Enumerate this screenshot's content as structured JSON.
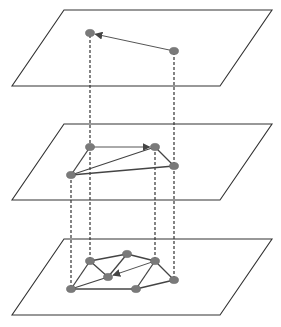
{
  "diagram": {
    "colors": {
      "plane_stroke": "#333333",
      "edge": "#444444",
      "arrow_edge": "#555555",
      "node_fill": "#7a7a7a",
      "dash": "#333333"
    },
    "planes": [
      {
        "name": "top-plane",
        "points": "64,10 272,10 220,86 12,86"
      },
      {
        "name": "middle-plane",
        "points": "64,124 272,124 220,200 12,200"
      },
      {
        "name": "bottom-plane",
        "points": "64,239 272,239 220,315 12,315"
      }
    ],
    "dashed_lines": [
      {
        "x1": 90,
        "y1": 35,
        "x2": 90,
        "y2": 147
      },
      {
        "x1": 174,
        "y1": 52,
        "x2": 174,
        "y2": 166
      },
      {
        "x1": 90,
        "y1": 147,
        "x2": 90,
        "y2": 261
      },
      {
        "x1": 155,
        "y1": 147,
        "x2": 155,
        "y2": 261
      },
      {
        "x1": 174,
        "y1": 166,
        "x2": 174,
        "y2": 280
      },
      {
        "x1": 71,
        "y1": 175,
        "x2": 71,
        "y2": 289
      }
    ],
    "layers": [
      {
        "name": "top",
        "nodes": [
          {
            "id": "t1",
            "x": 90,
            "y": 33
          },
          {
            "id": "t2",
            "x": 174,
            "y": 51
          }
        ],
        "edges": [],
        "arrows": [
          {
            "from": "t2",
            "to": "t1"
          }
        ]
      },
      {
        "name": "middle",
        "nodes": [
          {
            "id": "m1",
            "x": 90,
            "y": 147
          },
          {
            "id": "m2",
            "x": 155,
            "y": 147
          },
          {
            "id": "m3",
            "x": 174,
            "y": 166
          },
          {
            "id": "m4",
            "x": 71,
            "y": 175
          }
        ],
        "edges": [
          {
            "from": "m1",
            "to": "m4"
          },
          {
            "from": "m4",
            "to": "m2"
          },
          {
            "from": "m4",
            "to": "m3"
          },
          {
            "from": "m2",
            "to": "m3"
          }
        ],
        "arrows": [
          {
            "from": "m1",
            "to": "m2"
          }
        ]
      },
      {
        "name": "bottom",
        "nodes": [
          {
            "id": "b1",
            "x": 90,
            "y": 261
          },
          {
            "id": "b2",
            "x": 127,
            "y": 254
          },
          {
            "id": "b3",
            "x": 155,
            "y": 261
          },
          {
            "id": "b4",
            "x": 108,
            "y": 277
          },
          {
            "id": "b5",
            "x": 71,
            "y": 289
          },
          {
            "id": "b6",
            "x": 136,
            "y": 289
          },
          {
            "id": "b7",
            "x": 174,
            "y": 280
          }
        ],
        "edges": [
          {
            "from": "b1",
            "to": "b2"
          },
          {
            "from": "b2",
            "to": "b3"
          },
          {
            "from": "b1",
            "to": "b5"
          },
          {
            "from": "b1",
            "to": "b4"
          },
          {
            "from": "b2",
            "to": "b4"
          },
          {
            "from": "b5",
            "to": "b4"
          },
          {
            "from": "b5",
            "to": "b6"
          },
          {
            "from": "b6",
            "to": "b3"
          },
          {
            "from": "b6",
            "to": "b7"
          },
          {
            "from": "b3",
            "to": "b7"
          }
        ],
        "arrows": [
          {
            "from": "b3",
            "to": "b4"
          }
        ]
      }
    ]
  }
}
